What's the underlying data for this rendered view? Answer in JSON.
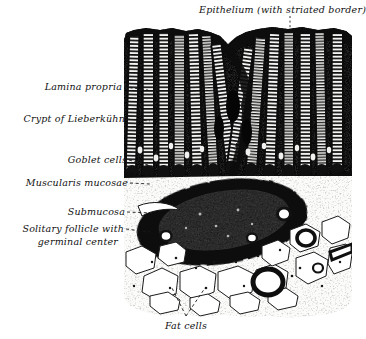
{
  "figure": {
    "background_color": "#ffffff",
    "ink_color": "#111111",
    "illustration_bounds": {
      "x": 124,
      "y": 27,
      "width": 228,
      "height": 291
    }
  },
  "labels": {
    "epithelium": "Epithelium (with striated border)",
    "lamina_propria": "Lamina propria",
    "crypt": "Crypt of Lieberkühn",
    "goblet_cells": "Goblet cells",
    "muscularis_mucosae": "Muscularis mucosae",
    "submucosa": "Submucosa",
    "follicle_line1": "Solitary follicle with",
    "follicle_line2": "germinal center",
    "fat_cells": "Fat cells"
  },
  "structures": [
    {
      "name": "epithelium",
      "zone": "surface",
      "description": "dark columnar surface epithelium with striated border"
    },
    {
      "name": "crypts-of-lieberkuhn",
      "zone": "mucosa",
      "count": 14,
      "description": "vertical tubular glands with white lumina and ladder striations"
    },
    {
      "name": "lamina-propria",
      "zone": "mucosa",
      "description": "stippled connective tissue between crypts"
    },
    {
      "name": "goblet-cells",
      "zone": "mucosa",
      "description": "clear oval cells lining crypt walls"
    },
    {
      "name": "muscularis-mucosae",
      "zone": "boundary",
      "description": "dark horizontal smooth-muscle band beneath crypt bases"
    },
    {
      "name": "solitary-lymphoid-follicle",
      "zone": "submucosa",
      "description": "large dark oval nodule with paler germinal center"
    },
    {
      "name": "germinal-center",
      "zone": "submucosa",
      "description": "pale stippled core of the follicle"
    },
    {
      "name": "submucosa",
      "zone": "submucosa",
      "description": "loose tissue with vessels beneath muscularis mucosae"
    },
    {
      "name": "fat-cells",
      "zone": "submucosa",
      "description": "large clear polygonal adipocytes with thin septa"
    },
    {
      "name": "blood-vessels",
      "zone": "submucosa",
      "count": 6,
      "description": "ring-shaped vessel cross sections"
    }
  ]
}
